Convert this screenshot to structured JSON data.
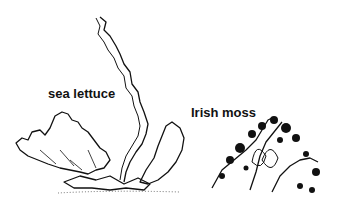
{
  "illustration": {
    "labels": {
      "sea_lettuce": "sea lettuce",
      "irish_moss": "Irish moss"
    },
    "colors": {
      "ink": "#111111",
      "background": "#ffffff"
    }
  }
}
